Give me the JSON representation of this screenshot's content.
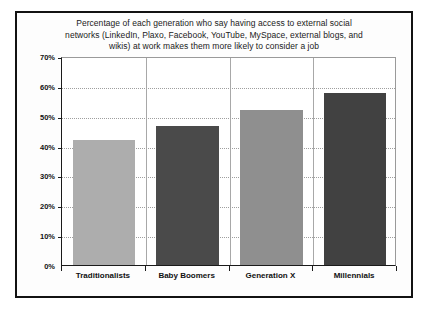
{
  "chart_data": {
    "type": "bar",
    "title_lines": [
      "Percentage of each generation who say having access to external social",
      "networks (LinkedIn, Plaxo, Facebook, YouTube, MySpace, external blogs, and",
      "wikis) at work makes them more likely to consider a job"
    ],
    "categories": [
      "Traditionalists",
      "Baby Boomers",
      "Generation X",
      "Millennials"
    ],
    "values": [
      42,
      46.5,
      52,
      57.5
    ],
    "value_labels": [
      "42%",
      "46.5%",
      "52%",
      "57.5%"
    ],
    "xlabel": "",
    "ylabel": "",
    "ylim": [
      0,
      70
    ],
    "ytick_values": [
      0,
      10,
      20,
      30,
      40,
      50,
      60,
      70
    ],
    "ytick_labels": [
      "0%",
      "10%",
      "20%",
      "30%",
      "40%",
      "50%",
      "60%",
      "70%"
    ],
    "grid": true,
    "grid_axis": "y",
    "grid_style": "dotted",
    "legend": false,
    "legend_position": "none",
    "bar_colors": [
      "#adadad",
      "#4a4a4a",
      "#8f8f8f",
      "#414141"
    ],
    "colors": {
      "bar_light": "#adadad",
      "bar_dark": "#4a4a4a",
      "axis": "#1a1a1a",
      "grid": "#9e9e9e",
      "frame": "#121212",
      "background": "#ffffff",
      "text": "#111111"
    }
  }
}
